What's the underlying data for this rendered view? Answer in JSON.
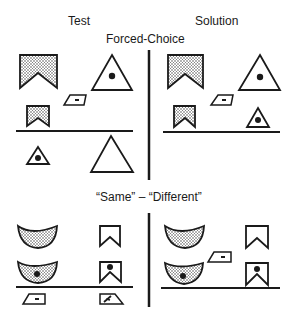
{
  "headers": {
    "test": "Test",
    "solution": "Solution"
  },
  "sections": {
    "forced_choice": {
      "title": "Forced-Choice",
      "test_panel": {
        "sample": [
          "large-stippled-notched-banner",
          "large-triangle-with-dot"
        ],
        "relational_cue": "small-parallelogram-with-dash",
        "sample_small": [
          "small-stippled-notched-banner"
        ],
        "choices": [
          "small-triangle-with-dot",
          "large-empty-triangle"
        ]
      },
      "solution_panel": {
        "sample": [
          "large-stippled-notched-banner",
          "large-triangle-with-dot"
        ],
        "relational_cue": "small-parallelogram-with-dash",
        "answer": [
          "small-stippled-notched-banner",
          "small-triangle-with-dot"
        ]
      }
    },
    "same_different": {
      "title": "“Same” – “Different”",
      "test_panel": {
        "rows": [
          [
            "stippled-crescent",
            "empty-notched-banner"
          ],
          [
            "stippled-crescent-with-dot",
            "notched-banner-with-dot"
          ]
        ],
        "options": [
          "same-symbol-parallelogram-with-dash",
          "different-symbol-trapezoid-with-slash"
        ]
      },
      "solution_panel": {
        "rows": [
          [
            "stippled-crescent",
            "empty-notched-banner"
          ],
          [
            "stippled-crescent-with-dot",
            "notched-banner-with-dot"
          ]
        ],
        "answer": "same-symbol-parallelogram-with-dash"
      }
    }
  },
  "colors": {
    "ink": "#1a1a1a",
    "background": "#ffffff"
  }
}
